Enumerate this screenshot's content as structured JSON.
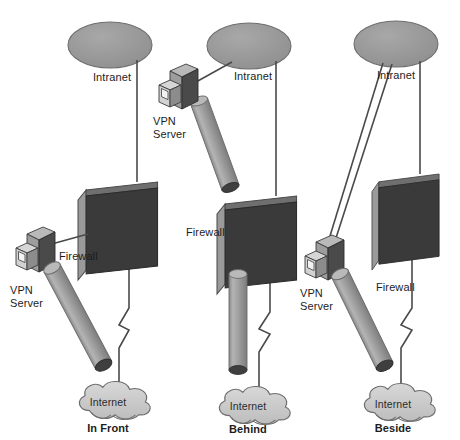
{
  "figure": {
    "type": "network-topology-diagram",
    "background": "#ffffff"
  },
  "colors": {
    "firewall_face": "#3a3a3a",
    "firewall_edge": "#8f8f8f",
    "firewall_top": "#6f6f6f",
    "tunnel_body": "#9a9a9a",
    "tunnel_cap": "#3f3f3f",
    "intranet_fill": "#999999",
    "internet_fill": "#c9c9c9",
    "server_dark": "#4a4a4a",
    "server_mid": "#8c8c8c",
    "server_light": "#d2d2d2",
    "line": "#4a4a4a",
    "text": "#1d1d1d"
  },
  "legend_terms": {
    "vpn_server": "VPN\nServer",
    "firewall": "Firewall",
    "intranet": "Intranet",
    "internet": "Internet"
  },
  "scenarios": [
    {
      "id": "in-front",
      "caption": "In Front",
      "intranet_label": "Intranet",
      "firewall_label": "Firewall",
      "server_label_line1": "VPN",
      "server_label_line2": "Server",
      "internet_label": "Internet",
      "description": "VPN server sits in front of the firewall; the encrypted tunnel runs from the server directly down to the Internet cloud, and a plain link joins the server to the firewall. The Intranet connects through the firewall down to the Internet."
    },
    {
      "id": "behind",
      "caption": "Behind",
      "intranet_label": "Intranet",
      "firewall_label": "Firewall",
      "server_label_line1": "VPN",
      "server_label_line2": "Server",
      "internet_label": "Internet",
      "description": "VPN server sits behind the firewall; the tunnel passes through the firewall in two segments before reaching the Internet cloud. The server also links to the Intranet."
    },
    {
      "id": "beside",
      "caption": "Beside",
      "intranet_label": "Intranet",
      "firewall_label": "Firewall",
      "server_label_line1": "VPN",
      "server_label_line2": "Server",
      "internet_label": "Internet",
      "description": "VPN server sits beside the firewall on a parallel path; two links run from the server up to the Intranet while its own tunnel runs down to the Internet independently of the firewall path."
    }
  ],
  "panels": {
    "count": 3,
    "order": [
      "in-front",
      "behind",
      "beside"
    ]
  }
}
